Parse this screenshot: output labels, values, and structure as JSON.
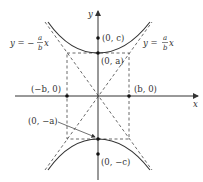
{
  "diagram": {
    "type": "hyperbola",
    "axes": {
      "x_label": "x",
      "y_label": "y"
    },
    "asymptotes": {
      "left": {
        "lhs": "y = −",
        "num": "a",
        "den": "b",
        "var": "x"
      },
      "right": {
        "lhs": "y = ",
        "num": "a",
        "den": "b",
        "var": "x"
      }
    },
    "points": {
      "vertex_top": "(0, a)",
      "focus_top": "(0, c)",
      "co_vertex_left": "(−b, 0)",
      "co_vertex_right": "(b, 0)",
      "vertex_bottom": "(0, −a)",
      "focus_bottom": "(0, −c)"
    },
    "colors": {
      "curve": "#333333",
      "axis": "#333333",
      "dashed": "#444444"
    }
  }
}
